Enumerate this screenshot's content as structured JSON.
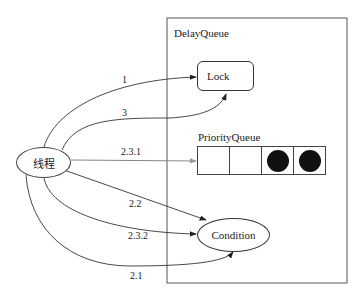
{
  "diagram": {
    "container": {
      "title": "DelayQueue"
    },
    "nodes": {
      "thread": "线程",
      "lock": "Lock",
      "priority_queue": {
        "title": "PriorityQueue",
        "cells": [
          "empty",
          "empty",
          "filled",
          "filled"
        ]
      },
      "condition": "Condition"
    },
    "edges": [
      {
        "label": "1",
        "from": "线程",
        "to": "Lock"
      },
      {
        "label": "3",
        "from": "线程",
        "to": "Lock"
      },
      {
        "label": "2.3.1",
        "from": "线程",
        "to": "PriorityQueue"
      },
      {
        "label": "2.2",
        "from": "线程",
        "to": "Condition"
      },
      {
        "label": "2.3.2",
        "from": "线程",
        "to": "Condition"
      },
      {
        "label": "2.1",
        "from": "线程",
        "to": "Condition"
      }
    ],
    "colors": {
      "stroke": "#333333",
      "arrow_gray": "#888888",
      "fill_dot": "#111111"
    }
  }
}
